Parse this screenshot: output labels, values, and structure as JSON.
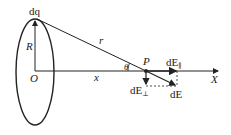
{
  "diagram": {
    "labels": {
      "dq": "dq",
      "R": "R",
      "r": "r",
      "O": "O",
      "x": "x",
      "theta": "θ",
      "P": "P",
      "X": "X",
      "dE_parallel": "dE",
      "dE_parallel_sub": "∥",
      "dE_perp": "dE",
      "dE_perp_sub": "⊥",
      "dE": "dE"
    },
    "colors": {
      "stroke": "#222222",
      "background": "#ffffff"
    }
  }
}
